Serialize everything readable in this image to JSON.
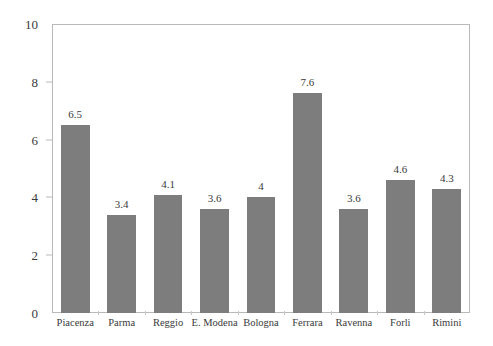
{
  "chart_data": {
    "type": "bar",
    "title": "",
    "subtitle": "",
    "xlabel": "",
    "ylabel": "",
    "ylim": [
      0,
      10
    ],
    "yticks": [
      0,
      2,
      4,
      6,
      8,
      10
    ],
    "ytick_labels": [
      "0",
      "2",
      "4",
      "6",
      "8",
      "10"
    ],
    "grid": false,
    "legend": false,
    "legend_position": "none",
    "bar_color": "#7d7d7d",
    "frame_color": "#b9b9b9",
    "text_color": "#3a3a3a",
    "background": "#ffffff",
    "categories": [
      "Piacenza",
      "Parma",
      "Reggio",
      "E. Modena",
      "Bologna",
      "Ferrara",
      "Ravenna",
      "Forli",
      "Rimini"
    ],
    "values": [
      6.5,
      3.4,
      4.1,
      3.6,
      4,
      7.6,
      3.6,
      4.6,
      4.3
    ],
    "value_labels": [
      "6.5",
      "3.4",
      "4.1",
      "3.6",
      "4",
      "7.6",
      "3.6",
      "4.6",
      "4.3"
    ]
  }
}
